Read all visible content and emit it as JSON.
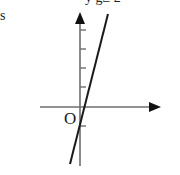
{
  "diagram": {
    "type": "coordinate-graph",
    "origin_label": "O",
    "partial_top_text": "y g≥ 2",
    "partial_left_text": "s",
    "colors": {
      "background": "#ffffff",
      "axis": "#6e6e6e",
      "line": "#1a1a1a",
      "text": "#1a1a1a"
    },
    "axes": {
      "x": {
        "y": 107,
        "from": 40,
        "to": 161,
        "arrow": "right"
      },
      "y": {
        "x": 80,
        "from": 166,
        "to": 12,
        "arrow": "up",
        "ticks": [
          30,
          49,
          68,
          87,
          126
        ]
      }
    },
    "line": {
      "x1": 108,
      "y1": 14,
      "x2": 70,
      "y2": 164,
      "description": "steep increasing straight line crossing just right of origin"
    }
  }
}
